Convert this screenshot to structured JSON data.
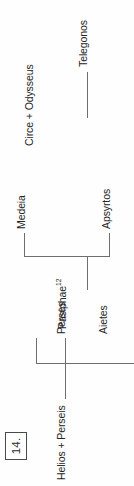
{
  "figure": {
    "number_label": "14.",
    "orientation": "rotated-90-ccw",
    "ink_color": "#6e6e6e",
    "text_color": "#252525"
  },
  "tree": {
    "root": {
      "label": "Helios + Perseis",
      "name": "helios-perseis"
    },
    "generation_two": [
      {
        "label": "Perses",
        "name": "perses"
      },
      {
        "label": "Aietes",
        "name": "aietes"
      },
      {
        "label": "Pasiphae",
        "superscript": "12",
        "name": "pasiphae"
      },
      {
        "label": "Circe + Odysseus",
        "name": "circe-odysseus"
      }
    ],
    "children_of_aietes": [
      {
        "label": "Apsyrtos",
        "name": "apsyrtos"
      },
      {
        "label": "Medeia",
        "name": "medeia"
      }
    ],
    "children_of_circe": [
      {
        "label": "Telegonos",
        "name": "telegonos"
      }
    ]
  }
}
